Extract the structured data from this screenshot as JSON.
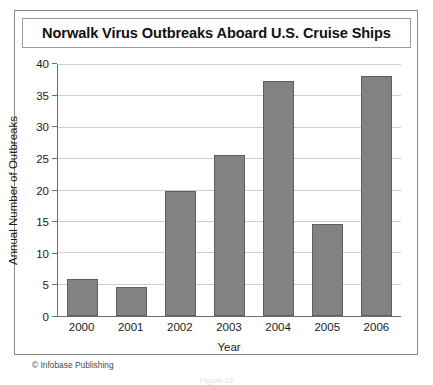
{
  "figure": {
    "title": "Norwalk Virus Outbreaks Aboard U.S. Cruise Ships",
    "credit": "© Infobase Publishing",
    "bottom_caption": "Figure 12"
  },
  "colors": {
    "bar_fill": "#828282",
    "bar_border": "#5e5e5e",
    "gridline": "#cfcfcf",
    "axis": "#6e6e6e",
    "frame": "#8a8a8a",
    "text": "#1a1a1a"
  },
  "chart_data": {
    "type": "bar",
    "title": "Norwalk Virus Outbreaks Aboard U.S. Cruise Ships",
    "xlabel": "Year",
    "ylabel": "Annual Number of Outbreaks",
    "categories": [
      "2000",
      "2001",
      "2002",
      "2003",
      "2004",
      "2005",
      "2006"
    ],
    "values": [
      5.9,
      4.6,
      20.0,
      25.7,
      37.4,
      14.7,
      38.3
    ],
    "ylim": [
      0,
      40
    ],
    "yticks": [
      0,
      5,
      10,
      15,
      20,
      25,
      30,
      35,
      40
    ],
    "ytick_labels": [
      "0",
      "5",
      "10",
      "15",
      "20",
      "25",
      "30",
      "35",
      "40"
    ],
    "grid": true,
    "legend": null
  }
}
